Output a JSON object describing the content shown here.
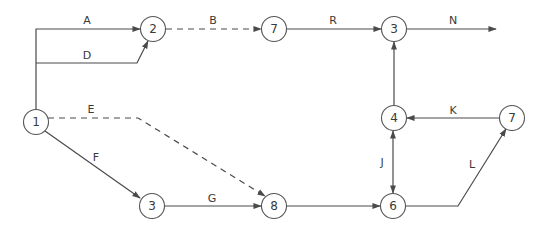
{
  "diagram": {
    "type": "activity-network",
    "colors": {
      "line": "#4a4a4a",
      "node_outline": "#555555",
      "text": "#3a3a3a",
      "background": "#ffffff"
    },
    "nodes": [
      {
        "id": "n1",
        "label": "1",
        "x": 36,
        "y": 122
      },
      {
        "id": "n2",
        "label": "2",
        "x": 153,
        "y": 29
      },
      {
        "id": "n7a",
        "label": "7",
        "x": 274,
        "y": 29
      },
      {
        "id": "n3a",
        "label": "3",
        "x": 394,
        "y": 29
      },
      {
        "id": "n4",
        "label": "4",
        "x": 394,
        "y": 118
      },
      {
        "id": "n7b",
        "label": "7",
        "x": 512,
        "y": 118
      },
      {
        "id": "n3b",
        "label": "3",
        "x": 152,
        "y": 206
      },
      {
        "id": "n8",
        "label": "8",
        "x": 274,
        "y": 206
      },
      {
        "id": "n6",
        "label": "6",
        "x": 393,
        "y": 206
      }
    ],
    "edges": [
      {
        "id": "A",
        "label": "A",
        "from": "n1",
        "to": "n2",
        "style": "solid",
        "label_x": 87,
        "label_y": 20
      },
      {
        "id": "D",
        "label": "D",
        "from": "n1",
        "to": "n2",
        "style": "solid",
        "label_x": 87,
        "label_y": 55
      },
      {
        "id": "B",
        "label": "B",
        "from": "n2",
        "to": "n7a",
        "style": "dashed",
        "label_x": 213,
        "label_y": 20
      },
      {
        "id": "R",
        "label": "R",
        "from": "n7a",
        "to": "n3a",
        "style": "solid",
        "label_x": 333,
        "label_y": 20
      },
      {
        "id": "N",
        "label": "N",
        "from": "n3a",
        "to": null,
        "style": "solid",
        "label_x": 453,
        "label_y": 20
      },
      {
        "id": "E",
        "label": "E",
        "from": "n1",
        "to": "n8",
        "style": "dashed",
        "label_x": 91,
        "label_y": 109
      },
      {
        "id": "F",
        "label": "F",
        "from": "n1",
        "to": "n3b",
        "style": "solid",
        "label_x": 96,
        "label_y": 157
      },
      {
        "id": "G",
        "label": "G",
        "from": "n3b",
        "to": "n8",
        "style": "solid",
        "label_x": 212,
        "label_y": 198
      },
      {
        "id": "H",
        "label": "",
        "from": "n8",
        "to": "n6",
        "style": "solid",
        "label_x": 333,
        "label_y": 198
      },
      {
        "id": "J",
        "label": "J",
        "from": "n4",
        "to": "n6",
        "style": "solid-double",
        "label_x": 382,
        "label_y": 162
      },
      {
        "id": "K",
        "label": "K",
        "from": "n7b",
        "to": "n4",
        "style": "solid",
        "label_x": 453,
        "label_y": 110
      },
      {
        "id": "L",
        "label": "L",
        "from": "n6",
        "to": "n7b",
        "style": "solid",
        "label_x": 472,
        "label_y": 164
      },
      {
        "id": "U",
        "label": "",
        "from": "n4",
        "to": "n3a",
        "style": "solid",
        "label_x": 0,
        "label_y": 0
      }
    ]
  }
}
